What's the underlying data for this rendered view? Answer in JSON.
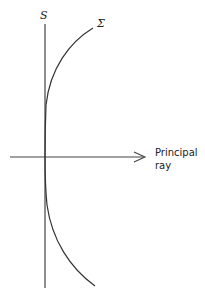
{
  "diagram": {
    "labels": {
      "s": "S",
      "sigma": "Σ",
      "axis_line1": "Principal",
      "axis_line2": "ray"
    },
    "colors": {
      "stroke": "#333333",
      "text": "#222222"
    }
  }
}
